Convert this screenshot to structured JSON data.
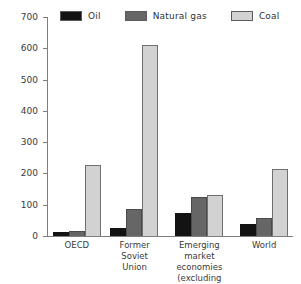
{
  "chart_data": {
    "type": "bar",
    "title": "",
    "subtitle": "",
    "xlabel": "",
    "ylabel": "",
    "ylim": [
      0,
      700
    ],
    "ytick_interval": 100,
    "yticks": [
      0,
      100,
      200,
      300,
      400,
      500,
      600,
      700
    ],
    "grid": false,
    "legend_position": "top",
    "categories": [
      "OECD",
      "Former Soviet Union",
      "Emerging market economies (excluding central Europe)",
      "World"
    ],
    "series": [
      {
        "name": "Oil",
        "color": "#131313",
        "values": [
          12,
          25,
          75,
          40
        ]
      },
      {
        "name": "Natural gas",
        "color": "#666666",
        "values": [
          16,
          85,
          125,
          58
        ]
      },
      {
        "name": "Coal",
        "color": "#d2d2d2",
        "values": [
          228,
          610,
          132,
          215
        ]
      }
    ]
  },
  "legend": {
    "items": [
      {
        "label": "Oil",
        "color": "#131313"
      },
      {
        "label": "Natural gas",
        "color": "#666666"
      },
      {
        "label": "Coal",
        "color": "#d2d2d2"
      }
    ]
  },
  "axis": {
    "y_tick_labels": [
      "0",
      "100",
      "200",
      "300",
      "400",
      "500",
      "600",
      "700"
    ]
  },
  "categories_display": [
    {
      "lines": [
        "OECD"
      ]
    },
    {
      "lines": [
        "Former",
        "Soviet",
        "Union"
      ]
    },
    {
      "lines": [
        "Emerging market",
        "economies (excluding",
        "central Europe)"
      ]
    },
    {
      "lines": [
        "World"
      ]
    }
  ]
}
